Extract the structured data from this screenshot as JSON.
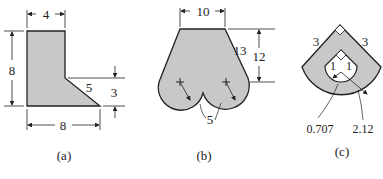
{
  "figure": {
    "fill_color": "#c8c8c8",
    "stroke_color": "#222222",
    "panels": [
      {
        "label": "(a)",
        "dimensions": {
          "top_width": "4",
          "left_height": "8",
          "bottom_width": "8",
          "slant": "5",
          "right_height": "3"
        }
      },
      {
        "label": "(b)",
        "dimensions": {
          "top_width": "10",
          "slant": "13",
          "height": "12",
          "radius": "5"
        }
      },
      {
        "label": "(c)",
        "dimensions": {
          "left_side": "3",
          "right_side": "3",
          "inner_left": "1",
          "inner_right": "1",
          "inner_radius": "0.707",
          "outer_radius": "2.12"
        }
      }
    ]
  }
}
